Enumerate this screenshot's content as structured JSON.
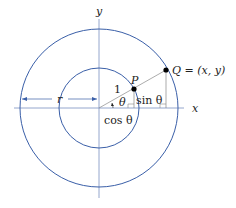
{
  "diagram": {
    "type": "polar-coordinates-unit-circle",
    "colors": {
      "circle": "#3a5fa8",
      "axis": "#7a8fc0",
      "line": "#888888",
      "text": "#222222",
      "point": "#000000"
    },
    "axes": {
      "x_label": "x",
      "y_label": "y"
    },
    "labels": {
      "radius_outer": "r",
      "radius_unit": "1",
      "angle": "θ",
      "point_p": "P",
      "point_q": "Q = (x, y)",
      "sin_label": "sin θ",
      "cos_label": "cos θ"
    }
  }
}
